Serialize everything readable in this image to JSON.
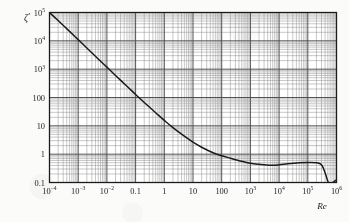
{
  "figure": {
    "name": "drag-coefficient-vs-reynolds-number",
    "background_color": "#fbfbfa",
    "ink_color": "#1b1b1b",
    "grid_major_color": "#4a4a4a",
    "grid_minor_color": "#8e8e8e"
  },
  "axes": {
    "y_title": "ζ",
    "y_title_prime": "′",
    "x_title": "Re"
  },
  "x_ticks": [
    {
      "mantissa": "10",
      "exponent": "−4",
      "value": 0.0001
    },
    {
      "mantissa": "10",
      "exponent": "−3",
      "value": 0.001
    },
    {
      "mantissa": "10",
      "exponent": "−2",
      "value": 0.01
    },
    {
      "mantissa": "0.1",
      "exponent": "",
      "value": 0.1
    },
    {
      "mantissa": "1",
      "exponent": "",
      "value": 1
    },
    {
      "mantissa": "10",
      "exponent": "",
      "value": 10
    },
    {
      "mantissa": "100",
      "exponent": "",
      "value": 100
    },
    {
      "mantissa": "10",
      "exponent": "3",
      "value": 1000
    },
    {
      "mantissa": "10",
      "exponent": "4",
      "value": 10000
    },
    {
      "mantissa": "10",
      "exponent": "5",
      "value": 100000
    },
    {
      "mantissa": "10",
      "exponent": "6",
      "value": 1000000
    }
  ],
  "y_ticks": [
    {
      "mantissa": "10",
      "exponent": "5",
      "value": 100000
    },
    {
      "mantissa": "10",
      "exponent": "4",
      "value": 10000
    },
    {
      "mantissa": "10",
      "exponent": "3",
      "value": 1000
    },
    {
      "mantissa": "100",
      "exponent": "",
      "value": 100
    },
    {
      "mantissa": "10",
      "exponent": "",
      "value": 10
    },
    {
      "mantissa": "1",
      "exponent": "",
      "value": 1
    },
    {
      "mantissa": "0.1",
      "exponent": "",
      "value": 0.1
    }
  ],
  "chart_data": {
    "type": "line",
    "title": "",
    "subtitle": "",
    "xlabel": "Re",
    "ylabel": "ζ′",
    "xscale": "log",
    "yscale": "log",
    "xlim": [
      0.0001,
      1000000
    ],
    "ylim": [
      0.1,
      100000
    ],
    "grid": true,
    "grid_minor": true,
    "legend": false,
    "legend_position": "none",
    "series": [
      {
        "name": "drag coefficient",
        "color": "#1b1b1b",
        "points": [
          [
            0.0001,
            100000
          ],
          [
            0.0002,
            52000
          ],
          [
            0.0005,
            21500
          ],
          [
            0.001,
            11000
          ],
          [
            0.002,
            5600
          ],
          [
            0.005,
            2300
          ],
          [
            0.01,
            1180
          ],
          [
            0.02,
            600
          ],
          [
            0.05,
            250
          ],
          [
            0.1,
            128
          ],
          [
            0.2,
            67
          ],
          [
            0.5,
            29
          ],
          [
            1.0,
            15.5
          ],
          [
            2.0,
            8.6
          ],
          [
            5.0,
            4.3
          ],
          [
            10.0,
            2.65
          ],
          [
            20.0,
            1.75
          ],
          [
            50.0,
            1.12
          ],
          [
            100.0,
            0.88
          ],
          [
            200.0,
            0.72
          ],
          [
            500.0,
            0.56
          ],
          [
            1000.0,
            0.48
          ],
          [
            2000.0,
            0.44
          ],
          [
            5000.0,
            0.405
          ],
          [
            10000.0,
            0.42
          ],
          [
            20000.0,
            0.46
          ],
          [
            50000.0,
            0.5
          ],
          [
            100000.0,
            0.51
          ],
          [
            200000.0,
            0.5
          ],
          [
            300000.0,
            0.42
          ],
          [
            400000.0,
            0.22
          ],
          [
            500000.0,
            0.11
          ],
          [
            600000.0,
            0.088
          ],
          [
            800000.0,
            0.105
          ],
          [
            1000000.0,
            0.125
          ]
        ]
      }
    ]
  }
}
